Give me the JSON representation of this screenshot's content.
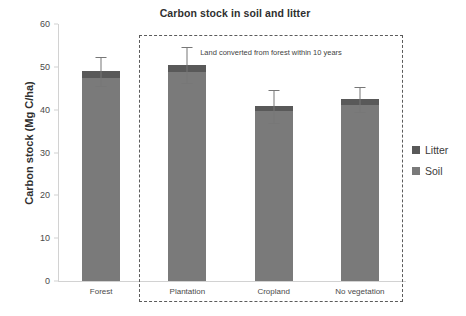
{
  "chart_data": {
    "type": "bar",
    "title": "Carbon stock in soil and litter",
    "xlabel": "",
    "ylabel": "Carbon stock (Mg C/ha)",
    "ylim": [
      0,
      60
    ],
    "yticks": [
      0,
      10,
      20,
      30,
      40,
      50,
      60
    ],
    "grid": false,
    "legend_position": "right",
    "stacked": true,
    "categories": [
      "Forest",
      "Plantation",
      "Cropland",
      "No vegetation"
    ],
    "series": [
      {
        "name": "Soil",
        "color": "#7a7a7a",
        "values": [
          47.5,
          48.8,
          39.6,
          41.0
        ]
      },
      {
        "name": "Litter",
        "color": "#595959",
        "values": [
          1.5,
          1.6,
          1.2,
          1.4
        ]
      }
    ],
    "totals": [
      49.0,
      50.4,
      40.8,
      42.4
    ],
    "errors": [
      3.4,
      4.2,
      3.8,
      3.0
    ],
    "annotations": [
      {
        "text": "Land converted from forest within 10 years",
        "covers": [
          "Plantation",
          "Cropland",
          "No vegetation"
        ],
        "style": "dashed-box"
      }
    ]
  },
  "legend": {
    "items": [
      {
        "label": "Litter",
        "color": "#595959"
      },
      {
        "label": "Soil",
        "color": "#7a7a7a"
      }
    ]
  }
}
